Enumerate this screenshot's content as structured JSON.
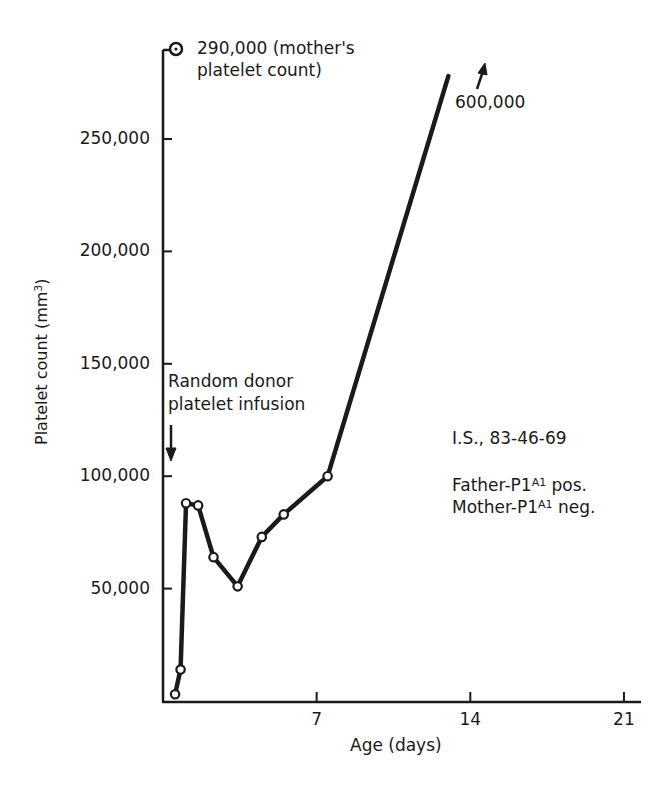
{
  "chart_data": {
    "type": "line",
    "title": "",
    "xlabel": "Age (days)",
    "ylabel": "Platelet count (mm³)",
    "ylabel_base": "Platelet count (mm",
    "ylabel_sup": "3",
    "ylabel_end": ")",
    "xlim": [
      0,
      22
    ],
    "ylim": [
      0,
      290000
    ],
    "x_ticks": [
      7,
      14,
      21
    ],
    "x_tick_labels": [
      "7",
      "14",
      "21"
    ],
    "y_ticks": [
      50000,
      100000,
      150000,
      200000,
      250000
    ],
    "y_tick_labels": [
      "50,000",
      "100,000",
      "150,000",
      "200,000",
      "250,000"
    ],
    "grid": false,
    "legend": null,
    "series": [
      {
        "name": "Infant platelet count",
        "x": [
          0.55,
          0.8,
          1.05,
          1.6,
          2.3,
          3.4,
          4.5,
          5.5,
          7.5,
          13
        ],
        "y": [
          3000,
          14000,
          88000,
          87000,
          64000,
          51000,
          73000,
          83000,
          100000,
          278000
        ],
        "markers": [
          true,
          true,
          true,
          true,
          true,
          true,
          true,
          true,
          true,
          false
        ]
      }
    ],
    "reference_points": [
      {
        "label": "290,000 (mother's platelet count)",
        "x": 0.6,
        "y": 290000,
        "marker": "circle-dot"
      }
    ],
    "annotations": [
      {
        "text": "290,000 (mother's",
        "line2": "platelet count)"
      },
      {
        "text": "600,000",
        "note": "arrow indicating value continues upward off chart"
      },
      {
        "text": "Random donor",
        "line2": "platelet infusion",
        "arrow_at_day": 0.4
      },
      {
        "text": "I.S., 83-46-69"
      },
      {
        "text": "Father-P1A1 pos."
      },
      {
        "text": "Mother-P1A1 neg."
      }
    ]
  },
  "labels": {
    "mother_line1": "290,000 (mother's",
    "mother_line2": "platelet count)",
    "off_chart": "600,000",
    "infusion_line1": "Random donor",
    "infusion_line2": "platelet infusion",
    "patient_id": "I.S., 83-46-69",
    "father_prefix": "Father-P1",
    "father_sup": "A1",
    "father_suffix": " pos.",
    "mother_prefix": "Mother-P1",
    "mother_sup": "A1",
    "mother_suffix": " neg."
  },
  "colors": {
    "ink": "#1a1a1a",
    "background": "#ffffff"
  }
}
